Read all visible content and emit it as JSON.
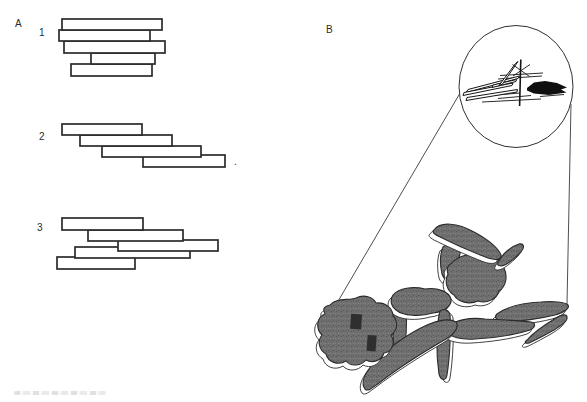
{
  "figure": {
    "background": "#ffffff",
    "ink": "#2b2b2b"
  },
  "panelA": {
    "label": "A",
    "trailing_period": ".",
    "groups": [
      {
        "label": "1",
        "bars": [
          [
            62,
            19,
            100,
            11
          ],
          [
            59,
            30,
            91,
            11
          ],
          [
            64,
            41,
            101,
            12
          ],
          [
            91,
            53,
            64,
            11
          ],
          [
            71,
            64,
            81,
            12
          ]
        ]
      },
      {
        "label": "2",
        "bars": [
          [
            62,
            124,
            80,
            11
          ],
          [
            80,
            135,
            92,
            11
          ],
          [
            102,
            146,
            99,
            11
          ],
          [
            143,
            155,
            82,
            12
          ]
        ]
      },
      {
        "label": "3",
        "bars": [
          [
            62,
            218,
            81,
            12
          ],
          [
            88,
            230,
            95,
            11
          ],
          [
            118,
            240,
            100,
            11
          ],
          [
            75,
            247,
            115,
            11
          ],
          [
            57,
            257,
            78,
            12
          ]
        ]
      }
    ]
  },
  "panelB": {
    "label": "B",
    "particle_fill": "#6f6f6f",
    "particle_speckle_dark": "#585858",
    "particle_speckle_light": "#828282",
    "particle_dark_patch": "#2f2f2f"
  }
}
